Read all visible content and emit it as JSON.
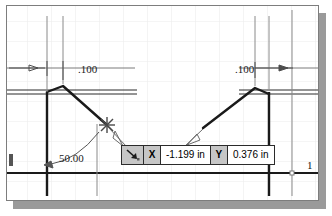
{
  "app": {
    "type": "cad-sketch-canvas",
    "background_color": "#ffffff",
    "frame_border_color": "#7d7d7d",
    "shadow_color": "#9a9a9a",
    "grid_color": "#ebebeb",
    "geometry_color": "#1a1a1a"
  },
  "grid": {
    "spacing_x": 24,
    "spacing_y": 20,
    "visible": true
  },
  "dimensions": [
    {
      "id": "left-offset",
      "label": ".100",
      "x": 78,
      "y": 64,
      "type": "linear"
    },
    {
      "id": "right-offset",
      "label": ".100",
      "x": 241,
      "y": 64,
      "type": "linear"
    },
    {
      "id": "draft-angle",
      "label": "50.00",
      "x": 58,
      "y": 152,
      "type": "angular"
    }
  ],
  "edge_markers": [
    {
      "id": "right-edge-number",
      "label": "1",
      "x": 308,
      "y": 160
    }
  ],
  "coord_tooltip": {
    "name": "coordinate-entry-tooltip",
    "cursor_icon": "diagonal-arrow-cursor-icon",
    "fields": [
      {
        "label": "X",
        "value": "-1.199 in"
      },
      {
        "label": "Y",
        "value": "0.376 in"
      }
    ],
    "label_bg": "#c6c6c6",
    "value_bg": "#ffffff",
    "border_color": "#2b2b2b"
  },
  "snap_marker": {
    "name": "snap-point-marker",
    "x": 100,
    "y": 119,
    "style": "asterisk"
  }
}
